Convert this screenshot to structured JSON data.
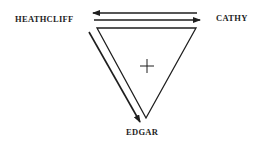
{
  "diagram": {
    "type": "relationship-triangle",
    "nodes": {
      "heathcliff": "HEATHCLIFF",
      "cathy": "CATHY",
      "edgar": "EDGAR"
    },
    "center_symbol": "+",
    "edges": [
      {
        "from": "CATHY",
        "to": "HEATHCLIFF",
        "kind": "arrow"
      },
      {
        "from": "HEATHCLIFF",
        "to": "CATHY",
        "kind": "arrow"
      },
      {
        "from": "HEATHCLIFF",
        "to": "EDGAR",
        "kind": "arrow"
      }
    ],
    "colors": {
      "ink": "#1e1e1e",
      "background": "#ffffff"
    }
  }
}
